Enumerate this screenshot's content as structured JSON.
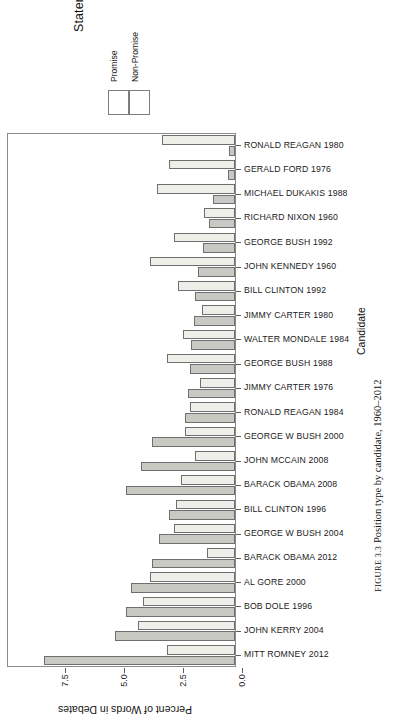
{
  "legend": {
    "title": "Statement Type",
    "keys": [
      {
        "label": "Promise",
        "color": "#c9c9c4"
      },
      {
        "label": "Non-Promise",
        "color": "#efefea"
      }
    ]
  },
  "axes": {
    "x_title": "Percent of Words in Debates",
    "y_title": "Candidate",
    "x_ticks": [
      "0.0",
      "2.5",
      "5.0",
      "7.5"
    ]
  },
  "caption": {
    "figure_no": "FIGURE 3.3",
    "text": "Position type by candidate, 1960–2012"
  },
  "chart_data": {
    "type": "bar",
    "orientation": "horizontal",
    "title": "Position type by candidate, 1960–2012",
    "xlabel": "Candidate",
    "ylabel": "Percent of Words in Debates",
    "ylim": [
      0,
      8.6
    ],
    "grid": false,
    "legend_position": "top-left",
    "legend_title": "Statement Type",
    "x_tick_values": [
      0.0,
      2.5,
      5.0,
      7.5
    ],
    "categories": [
      "RONALD REAGAN 1980",
      "GERALD FORD 1976",
      "MICHAEL DUKAKIS 1988",
      "RICHARD NIXON 1960",
      "GEORGE BUSH 1992",
      "JOHN KENNEDY 1960",
      "BILL CLINTON 1992",
      "JIMMY CARTER 1980",
      "WALTER MONDALE 1984",
      "GEORGE BUSH 1988",
      "JIMMY CARTER 1976",
      "RONALD REAGAN 1984",
      "GEORGE W BUSH 2000",
      "JOHN MCCAIN 2008",
      "BARACK OBAMA 2008",
      "BILL CLINTON 1996",
      "GEORGE W BUSH 2004",
      "BARACK OBAMA 2012",
      "AL GORE 2000",
      "BOB DOLE 1996",
      "JOHN KERRY 2004",
      "MITT ROMNEY 2012"
    ],
    "series": [
      {
        "name": "Promise",
        "color": "#c9c9c4",
        "values": [
          0.25,
          0.3,
          0.95,
          1.1,
          1.35,
          1.55,
          1.7,
          1.75,
          1.85,
          1.9,
          2.0,
          2.1,
          3.5,
          4.0,
          4.6,
          2.8,
          3.2,
          3.5,
          4.4,
          4.6,
          5.1,
          8.1
        ]
      },
      {
        "name": "Non-Promise",
        "color": "#efefea",
        "values": [
          3.1,
          2.8,
          3.3,
          1.3,
          2.6,
          3.6,
          2.4,
          1.4,
          2.2,
          2.9,
          1.5,
          1.9,
          2.1,
          1.7,
          2.3,
          2.5,
          2.6,
          1.2,
          3.6,
          3.9,
          4.1,
          2.9
        ]
      }
    ]
  }
}
